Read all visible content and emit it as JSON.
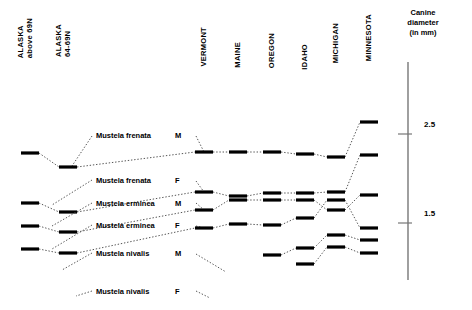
{
  "figure": {
    "axis_title": "Canine\ndiameter\n(in mm)",
    "axis_ticks": [
      {
        "value": "2.5",
        "y": 134
      },
      {
        "value": "1.5",
        "y": 223
      }
    ],
    "axis_line": {
      "x": 408,
      "y_top": 62,
      "y_bottom": 280
    },
    "marker_color": "#000000",
    "line_color": "#555555"
  },
  "columns": [
    {
      "id": "alaska-above-69n",
      "label": "ALASKA\nabove 69N",
      "x": 30,
      "header_x": 17,
      "header_y": 18
    },
    {
      "id": "alaska-64-69n",
      "label": "ALASKA\n64-69N",
      "x": 68,
      "header_x": 55,
      "header_y": 24
    },
    {
      "id": "vermont",
      "label": "VERMONT",
      "x": 204,
      "header_x": 200,
      "header_y": 27
    },
    {
      "id": "maine",
      "label": "MAINE",
      "x": 238,
      "header_x": 234,
      "header_y": 42
    },
    {
      "id": "oregon",
      "label": "OREGON",
      "x": 272,
      "header_x": 268,
      "header_y": 33
    },
    {
      "id": "idaho",
      "label": "IDAHO",
      "x": 305,
      "header_x": 301,
      "header_y": 44
    },
    {
      "id": "michigan",
      "label": "MICHIGAN",
      "x": 336,
      "header_x": 332,
      "header_y": 23
    },
    {
      "id": "minnesota",
      "label": "MINNESOTA",
      "x": 369,
      "header_x": 365,
      "header_y": 14
    }
  ],
  "series": [
    {
      "id": "mustela-frenata-male",
      "species": "Mustela frenata",
      "sex": "M",
      "label_x": 96,
      "label_y": 131,
      "sex_x": 175,
      "leader": [
        [
          92,
          136
        ],
        [
          72,
          166
        ]
      ],
      "leader2": [
        [
          196,
          136
        ],
        [
          204,
          152
        ]
      ],
      "points": [
        {
          "column": "alaska-above-69n",
          "y": 153
        },
        {
          "column": "alaska-64-69n",
          "y": 167
        },
        {
          "column": "vermont",
          "y": 152
        },
        {
          "column": "maine",
          "y": 152
        },
        {
          "column": "oregon",
          "y": 152
        },
        {
          "column": "idaho",
          "y": 154
        },
        {
          "column": "michigan",
          "y": 157
        },
        {
          "column": "minnesota",
          "y": 122
        }
      ]
    },
    {
      "id": "mustela-frenata-female",
      "species": "Mustela frenata",
      "sex": "F",
      "label_x": 96,
      "label_y": 176,
      "sex_x": 175,
      "leader": [
        [
          92,
          180
        ],
        [
          52,
          205
        ]
      ],
      "leader2": [
        [
          196,
          181
        ],
        [
          204,
          192
        ]
      ],
      "points": [
        {
          "column": "alaska-above-69n",
          "y": 203
        },
        {
          "column": "alaska-64-69n",
          "y": 212
        },
        {
          "column": "vermont",
          "y": 192
        },
        {
          "column": "maine",
          "y": 196
        },
        {
          "column": "oregon",
          "y": 193
        },
        {
          "column": "idaho",
          "y": 193
        },
        {
          "column": "michigan",
          "y": 192
        },
        {
          "column": "minnesota",
          "y": 155
        }
      ]
    },
    {
      "id": "mustela-erminea-male",
      "species": "Mustela erminea",
      "sex": "M",
      "label_x": 96,
      "label_y": 199,
      "sex_x": 175,
      "leader": [
        [
          92,
          203
        ],
        [
          52,
          226
        ]
      ],
      "leader2": [
        [
          196,
          203
        ],
        [
          204,
          210
        ]
      ],
      "points": [
        {
          "column": "alaska-above-69n",
          "y": 226
        },
        {
          "column": "alaska-64-69n",
          "y": 232
        },
        {
          "column": "vermont",
          "y": 210
        },
        {
          "column": "maine",
          "y": 200
        },
        {
          "column": "oregon",
          "y": 200
        },
        {
          "column": "idaho",
          "y": 200
        },
        {
          "column": "michigan",
          "y": 210
        },
        {
          "column": "minnesota",
          "y": 195
        }
      ]
    },
    {
      "id": "mustela-erminea-female",
      "species": "Mustela erminea",
      "sex": "F",
      "label_x": 96,
      "label_y": 221,
      "sex_x": 175,
      "leader": [
        [
          92,
          225
        ],
        [
          52,
          249
        ]
      ],
      "leader2": [
        [
          196,
          226
        ],
        [
          204,
          228
        ]
      ],
      "points": [
        {
          "column": "alaska-above-69n",
          "y": 249
        },
        {
          "column": "alaska-64-69n",
          "y": 253
        },
        {
          "column": "vermont",
          "y": 228
        },
        {
          "column": "maine",
          "y": 224
        },
        {
          "column": "oregon",
          "y": 225
        },
        {
          "column": "idaho",
          "y": 218
        },
        {
          "column": "michigan",
          "y": 200
        },
        {
          "column": "minnesota",
          "y": 228
        }
      ]
    },
    {
      "id": "mustela-nivalis-male",
      "species": "Mustela nivalis",
      "sex": "M",
      "label_x": 96,
      "label_y": 249,
      "sex_x": 175,
      "leader": [
        [
          92,
          253
        ],
        [
          62,
          270
        ]
      ],
      "leader2": [
        [
          196,
          254
        ],
        [
          226,
          272
        ]
      ],
      "points": [
        {
          "column": "oregon",
          "y": 255
        },
        {
          "column": "idaho",
          "y": 248
        },
        {
          "column": "michigan",
          "y": 235
        },
        {
          "column": "minnesota",
          "y": 240
        }
      ]
    },
    {
      "id": "mustela-nivalis-female",
      "species": "Mustela nivalis",
      "sex": "F",
      "label_x": 96,
      "label_y": 287,
      "sex_x": 175,
      "leader": [
        [
          92,
          291
        ],
        [
          76,
          296
        ]
      ],
      "leader2": [
        [
          196,
          291
        ],
        [
          210,
          298
        ]
      ],
      "points": [
        {
          "column": "idaho",
          "y": 264
        },
        {
          "column": "michigan",
          "y": 247
        },
        {
          "column": "minnesota",
          "y": 253
        }
      ]
    }
  ]
}
